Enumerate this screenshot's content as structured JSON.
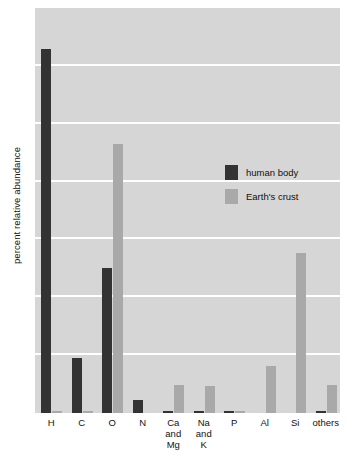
{
  "chart_data": {
    "type": "bar",
    "title": "",
    "xlabel": "",
    "ylabel": "percent relative abundance",
    "ylim": [
      0,
      70
    ],
    "yticks": [
      10,
      20,
      30,
      40,
      50,
      60,
      70
    ],
    "grid": true,
    "legend_position": "inside-upper-center",
    "categories": [
      "H",
      "C",
      "O",
      "N",
      "Ca and Mg",
      "Na and K",
      "P",
      "Al",
      "Si",
      "others"
    ],
    "category_lines": [
      [
        "H"
      ],
      [
        "C"
      ],
      [
        "O"
      ],
      [
        "N"
      ],
      [
        "Ca",
        "and",
        "Mg"
      ],
      [
        "Na",
        "and",
        "K"
      ],
      [
        "P"
      ],
      [
        "Al"
      ],
      [
        "Si"
      ],
      [
        "others"
      ]
    ],
    "series": [
      {
        "name": "human body",
        "color": "#333333",
        "values": [
          63.0,
          9.5,
          25.0,
          2.2,
          0.4,
          0.3,
          0.3,
          0.0,
          0.0,
          0.2
        ]
      },
      {
        "name": "Earth's crust",
        "color": "#a9a9a9",
        "values": [
          0.1,
          0.2,
          46.5,
          0.0,
          4.8,
          4.6,
          0.1,
          8.1,
          27.6,
          4.8
        ]
      }
    ]
  },
  "legend": {
    "items": [
      {
        "label": "human body",
        "color": "#333333"
      },
      {
        "label": "Earth's crust",
        "color": "#a9a9a9"
      }
    ]
  },
  "axes": {
    "y_title": "percent relative abundance"
  },
  "colors": {
    "plot_background": "#d6d6d6",
    "gridline": "#ffffff",
    "human_body": "#333333",
    "earths_crust": "#a9a9a9",
    "text": "#111111"
  }
}
